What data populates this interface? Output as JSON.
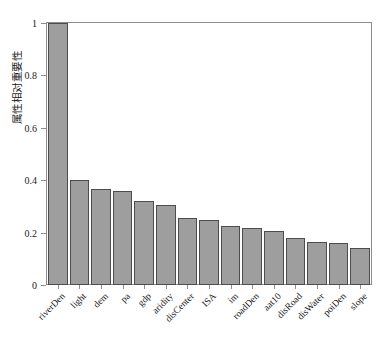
{
  "chart_data": {
    "type": "bar",
    "title": "",
    "xlabel": "",
    "ylabel": "属性相对重要性",
    "ylim": [
      0,
      1
    ],
    "ytick_labels": [
      "0",
      "0.2",
      "0.4",
      "0.6",
      "0.8",
      "1"
    ],
    "ytick_values": [
      0,
      0.2,
      0.4,
      0.6,
      0.8,
      1
    ],
    "grid": false,
    "legend": null,
    "bar_color": "#9e9e9e",
    "bar_edge_color": "#4d4d4d",
    "categories": [
      "riverDen",
      "light",
      "dem",
      "pa",
      "gdp",
      "aridity",
      "disCenter",
      "ISA",
      "im",
      "roadDen",
      "aat10",
      "disRoad",
      "disWater",
      "poiDen",
      "slope"
    ],
    "values": [
      1.0,
      0.4,
      0.365,
      0.36,
      0.32,
      0.305,
      0.255,
      0.25,
      0.225,
      0.218,
      0.205,
      0.18,
      0.163,
      0.161,
      0.142
    ]
  }
}
